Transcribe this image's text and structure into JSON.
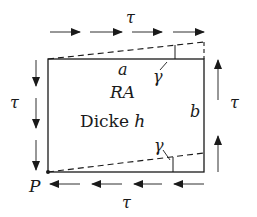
{
  "diagram": {
    "labels": {
      "tau_top": "τ",
      "tau_left": "τ",
      "tau_right": "τ",
      "tau_bottom": "τ",
      "side_a": "a",
      "side_b": "b",
      "element": "RA",
      "thickness_word": "Dicke",
      "thickness_symbol": "h",
      "gamma_top": "γ",
      "gamma_bottom": "γ",
      "point": "P"
    },
    "stress_arrows": {
      "top": {
        "direction": "right",
        "count": 4
      },
      "bottom": {
        "direction": "left",
        "count": 4
      },
      "left": {
        "direction": "down",
        "count": 3
      },
      "right": {
        "direction": "up",
        "count": 2
      }
    },
    "colors": {
      "line": "#1a1a1a",
      "background": "#ffffff"
    }
  }
}
